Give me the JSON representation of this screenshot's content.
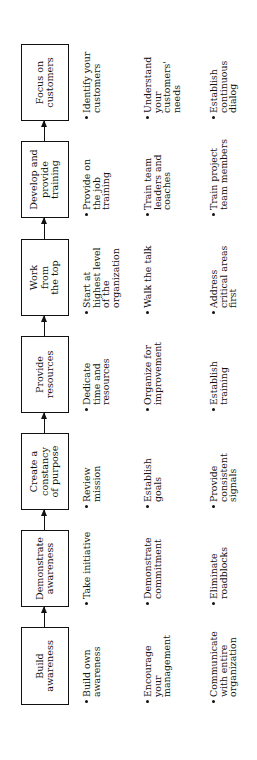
{
  "diagram": {
    "orientation": "rotated -90deg (reads bottom to top)",
    "stages": [
      {
        "title": "Build\nawareness",
        "bullets": [
          "Build own\nawareness",
          "Encourage\nyour\nmanagement",
          "Communicate\nwith entire\norganization"
        ]
      },
      {
        "title": "Demonstrate\nawareness",
        "bullets": [
          "Take initiative",
          "Demonstrate\ncommitment",
          "Eliminate\nroadblocks"
        ]
      },
      {
        "title": "Create a\nconstancy\nof purpose",
        "bullets": [
          "Review\nmission",
          "Establish\ngoals",
          "Provide\nconsistent\nsignals"
        ]
      },
      {
        "title": "Provide\nresources",
        "bullets": [
          "Dedicate\ntime and\nresources",
          "Organize for\nimprovement",
          "Establish\ntraining"
        ]
      },
      {
        "title": "Work\nfrom\nthe top",
        "bullets": [
          "Start at\nhighest level\nof the\norganization",
          "Walk the talk",
          "Address\ncritical areas\nfirst"
        ]
      },
      {
        "title": "Develop and\nprovide\ntraining",
        "bullets": [
          "Provide on\nthe job\ntraining",
          "Train team\nleaders and\ncoaches",
          "Train project\nteam members"
        ]
      },
      {
        "title": "Focus on\ncustomers",
        "bullets": [
          "Identify your\ncustomers",
          "Understand\nyour\ncustomers'\nneeds",
          "Establish\ncontinuous\ndialog"
        ]
      }
    ]
  }
}
